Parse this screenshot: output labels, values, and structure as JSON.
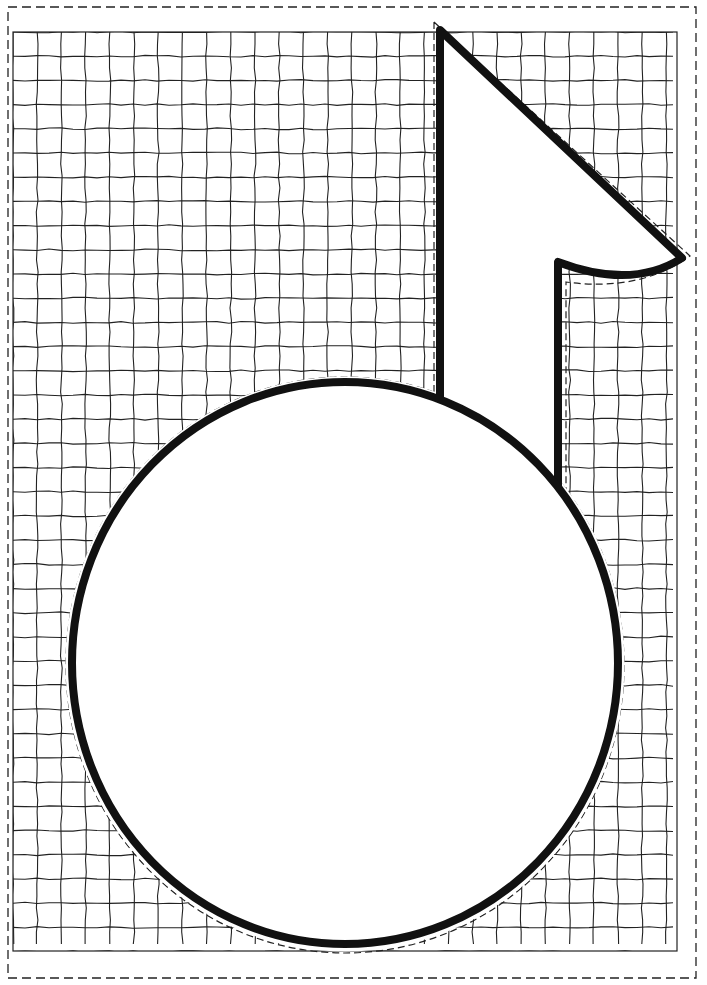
{
  "illustration": {
    "subject": "eighth-note-shape",
    "background_pattern": "hand-drawn-grid",
    "colors": {
      "paper": "#ffffff",
      "ink": "#111111",
      "grid": "#222222"
    },
    "canvas": {
      "width": 707,
      "height": 985
    },
    "outer_cut_border": {
      "x": 8,
      "y": 7,
      "width": 688,
      "height": 971,
      "style": "dashed"
    },
    "grid": {
      "x": 13,
      "y": 32,
      "width": 664,
      "height": 919,
      "cell": 24.2
    },
    "note_head": {
      "cx": 345,
      "cy": 663,
      "rx": 273,
      "ry": 281
    },
    "stem": {
      "left_x": 440,
      "right_x": 558,
      "top_y": 30
    },
    "flag": {
      "tip": [
        682,
        258
      ],
      "inner": [
        558,
        262
      ]
    }
  }
}
